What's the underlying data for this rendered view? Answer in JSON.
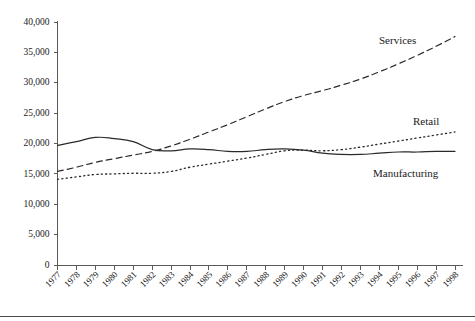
{
  "chart_data": {
    "type": "line",
    "title": "",
    "xlabel": "",
    "ylabel": "",
    "grid": false,
    "legend_position": "inline-annotations",
    "x": [
      1977,
      1978,
      1979,
      1980,
      1981,
      1982,
      1983,
      1984,
      1985,
      1986,
      1987,
      1988,
      1989,
      1990,
      1991,
      1992,
      1993,
      1994,
      1995,
      1996,
      1997,
      1998
    ],
    "xtick_labels": [
      "1977",
      "1978",
      "1979",
      "1980",
      "1981",
      "1982",
      "1983",
      "1984",
      "1985",
      "1986",
      "1987",
      "1988",
      "1989",
      "1990",
      "1991",
      "1992",
      "1993",
      "1994",
      "1995",
      "1996",
      "1997",
      "1998"
    ],
    "ytick_labels": [
      "0",
      "5,000",
      "10,000",
      "15,000",
      "20,000",
      "25,000",
      "30,000",
      "35,000",
      "40,000"
    ],
    "ytick_values": [
      0,
      5000,
      10000,
      15000,
      20000,
      25000,
      30000,
      35000,
      40000
    ],
    "ylim": [
      0,
      40000
    ],
    "xlim": [
      1977,
      1998
    ],
    "series": [
      {
        "name": "Services",
        "style": "dashed",
        "color": "#2a2a2a",
        "label": "Services",
        "values": [
          15400,
          16100,
          16900,
          17500,
          18100,
          18700,
          19600,
          20700,
          21900,
          23100,
          24400,
          25700,
          26900,
          27900,
          28700,
          29600,
          30600,
          31800,
          33100,
          34500,
          36000,
          37600
        ]
      },
      {
        "name": "Retail",
        "style": "dotted",
        "color": "#2a2a2a",
        "label": "Retail",
        "values": [
          14100,
          14500,
          14900,
          15000,
          15100,
          15100,
          15400,
          16100,
          16600,
          17100,
          17600,
          18200,
          18800,
          18900,
          18800,
          19000,
          19400,
          19900,
          20400,
          20900,
          21400,
          21900
        ]
      },
      {
        "name": "Manufacturing",
        "style": "solid",
        "color": "#2a2a2a",
        "label": "Manufacturing",
        "values": [
          19700,
          20300,
          21000,
          20800,
          20300,
          19000,
          18800,
          19100,
          19000,
          18700,
          18700,
          19000,
          19100,
          18900,
          18400,
          18200,
          18200,
          18400,
          18600,
          18600,
          18700,
          18700
        ]
      }
    ],
    "annotations": [
      {
        "text": "Services",
        "series": "Services"
      },
      {
        "text": "Retail",
        "series": "Retail"
      },
      {
        "text": "Manufacturing",
        "series": "Manufacturing"
      }
    ]
  }
}
